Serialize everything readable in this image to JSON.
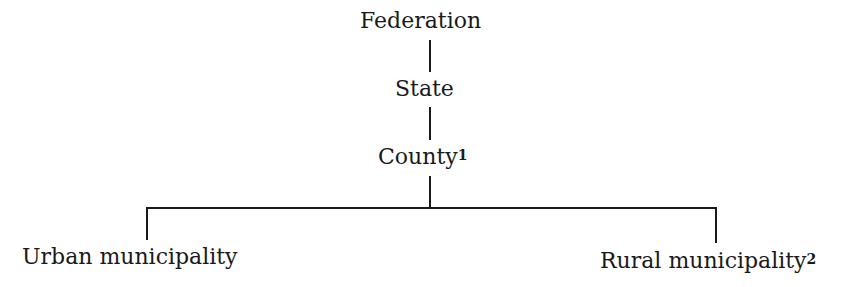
{
  "diagram": {
    "type": "hierarchy",
    "nodes": {
      "federation": {
        "label": "Federation"
      },
      "state": {
        "label": "State"
      },
      "county": {
        "label": "County",
        "footnote": "1"
      },
      "urban": {
        "label": "Urban municipality"
      },
      "rural": {
        "label": "Rural municipality",
        "footnote": "2"
      }
    },
    "edges": [
      [
        "Federation",
        "State"
      ],
      [
        "State",
        "County"
      ],
      [
        "County",
        "Urban municipality"
      ],
      [
        "County",
        "Rural municipality"
      ]
    ],
    "line_color": "#1a1a1a"
  }
}
